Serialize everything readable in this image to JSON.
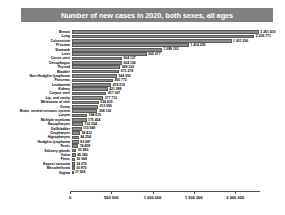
{
  "chart_data": {
    "type": "bar",
    "orientation": "horizontal",
    "title": "Number of new cases in 2020, both sexes, all ages",
    "xlabel": "",
    "ylabel": "",
    "xlim": [
      0,
      2300000
    ],
    "grid": false,
    "legend": "none",
    "tick_labels": [
      "0",
      "500 000",
      "1 000 000",
      "1 500 000",
      "2 000 000"
    ],
    "ticks": [
      0,
      500000,
      1000000,
      1500000,
      2000000
    ],
    "categories": [
      "Breast",
      "Lung",
      "Colorectum",
      "Prostate",
      "Stomach",
      "Liver",
      "Cervix uteri",
      "Oesophagus",
      "Thyroid",
      "Bladder",
      "Non-Hodgkin lymphoma",
      "Pancreas",
      "Leukaemia",
      "Kidney",
      "Corpus uteri",
      "Lip, oral cavity",
      "Melanoma of skin",
      "Ovary",
      "Brain, central nervous system",
      "Larynx",
      "Multiple myeloma",
      "Nasopharynx",
      "Gallbladder",
      "Oropharynx",
      "Hypopharynx",
      "Hodgkin lymphoma",
      "Testis",
      "Salivary glands",
      "Vulva",
      "Penis",
      "Kaposi sarcoma",
      "Mesothelioma",
      "Vagina"
    ],
    "values": [
      2261419,
      2206771,
      1931590,
      1414259,
      1089103,
      905677,
      604127,
      604100,
      586202,
      573278,
      544352,
      495773,
      474519,
      431288,
      417367,
      377713,
      324635,
      313959,
      308102,
      184615,
      176404,
      133354,
      115949,
      98412,
      84254,
      83087,
      74458,
      53583,
      45240,
      36068,
      34270,
      30870,
      17908
    ],
    "value_labels": [
      "2 261 419",
      "2 206 771",
      "1 931 590",
      "1 414 259",
      "1 089 103",
      "905 677",
      "604 127",
      "604 100",
      "586 202",
      "573 278",
      "544 352",
      "495 773",
      "474 519",
      "431 288",
      "417 367",
      "377 713",
      "324 635",
      "313 959",
      "308 102",
      "184 615",
      "176 404",
      "133 354",
      "115 949",
      "98 412",
      "84 254",
      "83 087",
      "74 458",
      "53 583",
      "45 240",
      "36 068",
      "34 270",
      "30 870",
      "17 908"
    ],
    "bar_color": "#8c8c8c",
    "title_banner_color": "#808080",
    "background_color": "#ffffff"
  }
}
